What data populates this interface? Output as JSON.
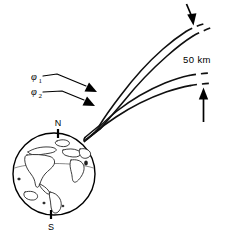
{
  "figure": {
    "title": "Ray paths launched at two elevation angles toward the 50 km layer",
    "background_color": "#ffffff",
    "ink_color": "#000000",
    "width": 233,
    "height": 236
  },
  "labels": {
    "altitude": "50 km",
    "angle_1_symbol": "φ",
    "angle_1_subscript": "1",
    "angle_2_symbol": "φ",
    "angle_2_subscript": "2",
    "north_pole": "N",
    "south_pole": "S"
  },
  "globe": {
    "name": "earth-globe",
    "center_x": 54,
    "center_y": 174,
    "radius": 41,
    "north_label": "N",
    "south_label": "S"
  },
  "rays": [
    {
      "name": "ray-upper-outer",
      "angle": "φ₁",
      "style": "solid-then-dashed",
      "terminates_at": "upper 50 km level"
    },
    {
      "name": "ray-upper-inner",
      "angle": "φ₁",
      "style": "solid-then-dashed",
      "terminates_at": "upper 50 km level"
    },
    {
      "name": "ray-lower-outer",
      "angle": "φ₂",
      "style": "solid-then-dashed",
      "terminates_at": "lower 50 km level"
    },
    {
      "name": "ray-lower-inner",
      "angle": "φ₂",
      "style": "solid-then-dashed",
      "terminates_at": "lower 50 km level"
    }
  ],
  "arrows": [
    {
      "name": "altitude-arrow-top",
      "direction": "down",
      "points_to": "upper dashed ray pair"
    },
    {
      "name": "altitude-arrow-bottom",
      "direction": "up",
      "points_to": "lower dashed ray pair"
    },
    {
      "name": "angle-1-leader-arrow",
      "direction": "right-down",
      "points_to": "upper ray bundle"
    },
    {
      "name": "angle-2-leader-arrow",
      "direction": "right-down",
      "points_to": "lower ray bundle"
    }
  ]
}
